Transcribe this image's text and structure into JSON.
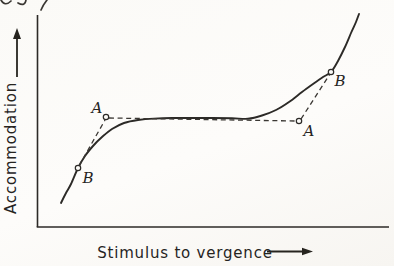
{
  "colors": {
    "ink": "#2c2a27",
    "paper": "#fcfbf8"
  },
  "chart_data": {
    "type": "line",
    "title": "",
    "xlabel": "Stimulus to vergence",
    "ylabel": "Accommodation",
    "axes_note": "qualitative sketch: no ticks or numeric scale; arrows show direction of increase",
    "plot_area_px": {
      "x_axis_y": 227,
      "y_axis_x": 37,
      "x_max": 389,
      "y_min": 15
    },
    "series": [
      {
        "name": "accommodation-response-curve",
        "style": "solid",
        "points": [
          [
            61,
            203
          ],
          [
            66,
            193
          ],
          [
            71,
            184
          ],
          [
            78,
            168
          ],
          [
            85,
            156
          ],
          [
            93,
            146
          ],
          [
            102,
            137
          ],
          [
            112,
            129
          ],
          [
            124,
            123
          ],
          [
            138,
            120
          ],
          [
            154,
            118.6
          ],
          [
            172,
            118
          ],
          [
            192,
            118
          ],
          [
            212,
            118
          ],
          [
            232,
            118.2
          ],
          [
            248,
            118.8
          ],
          [
            262,
            115.5
          ],
          [
            276,
            110
          ],
          [
            289,
            102
          ],
          [
            302,
            92
          ],
          [
            313,
            84
          ],
          [
            323,
            77
          ],
          [
            331,
            72
          ],
          [
            338,
            61
          ],
          [
            345,
            47
          ],
          [
            351,
            33
          ],
          [
            356,
            22
          ],
          [
            359,
            14
          ]
        ]
      },
      {
        "name": "tangent-chord-left",
        "style": "dashed",
        "points": [
          [
            79,
            166
          ],
          [
            105,
            120
          ]
        ]
      },
      {
        "name": "horizontal-chord",
        "style": "dashed",
        "points": [
          [
            109,
            118
          ],
          [
            296,
            121
          ]
        ]
      },
      {
        "name": "tangent-chord-right",
        "style": "dashed",
        "points": [
          [
            301,
            119
          ],
          [
            330,
            74
          ]
        ]
      }
    ],
    "point_markers": [
      {
        "label": "A",
        "px": [
          106,
          117
        ],
        "label_pos": [
          97,
          113
        ]
      },
      {
        "label": "B",
        "px": [
          78,
          168
        ],
        "label_pos": [
          88,
          183
        ]
      },
      {
        "label": "A",
        "px": [
          299,
          121
        ],
        "label_pos": [
          309,
          136
        ]
      },
      {
        "label": "B",
        "px": [
          331,
          72
        ],
        "label_pos": [
          340,
          86
        ]
      }
    ]
  },
  "fragments": {
    "top_edge": "cropped remnants of text from the line above (illegible)"
  }
}
